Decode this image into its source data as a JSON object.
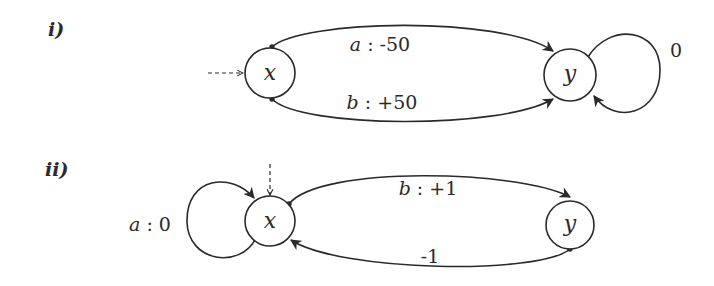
{
  "diagrams": [
    {
      "panel_label": "i)",
      "nodes": [
        {
          "id": "x",
          "label": "x",
          "initial": true
        },
        {
          "id": "y",
          "label": "y",
          "initial": false
        }
      ],
      "edges": [
        {
          "from": "x",
          "to": "y",
          "label_action": "a",
          "label_sep": " : ",
          "label_value": "-50"
        },
        {
          "from": "x",
          "to": "y",
          "label_action": "b",
          "label_sep": " : ",
          "label_value": "+50"
        },
        {
          "from": "y",
          "to": "y",
          "label_action": "",
          "label_sep": "",
          "label_value": "0"
        }
      ]
    },
    {
      "panel_label": "ii)",
      "nodes": [
        {
          "id": "x",
          "label": "x",
          "initial": true
        },
        {
          "id": "y",
          "label": "y",
          "initial": false
        }
      ],
      "edges": [
        {
          "from": "x",
          "to": "x",
          "label_action": "a",
          "label_sep": " : ",
          "label_value": "0"
        },
        {
          "from": "x",
          "to": "y",
          "label_action": "b",
          "label_sep": " : ",
          "label_value": "+1"
        },
        {
          "from": "y",
          "to": "x",
          "label_action": "",
          "label_sep": "",
          "label_value": "-1"
        }
      ]
    }
  ],
  "colors": {
    "stroke": "#2a2a2a",
    "background": "#ffffff"
  }
}
